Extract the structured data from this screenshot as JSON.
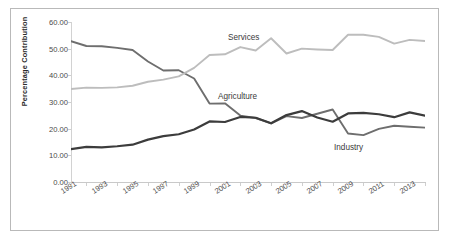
{
  "chart_data": {
    "type": "line",
    "title": "",
    "subtitle": "",
    "xlabel": "",
    "ylabel": "Percentage Contribution",
    "xlim": [
      1991,
      2014
    ],
    "ylim": [
      0,
      60
    ],
    "grid": false,
    "legend_position": "inline-annotations",
    "x": [
      1991,
      1992,
      1993,
      1994,
      1995,
      1996,
      1997,
      1998,
      1999,
      2000,
      2001,
      2002,
      2003,
      2004,
      2005,
      2006,
      2007,
      2008,
      2009,
      2010,
      2011,
      2012,
      2013,
      2014
    ],
    "y_ticks": [
      0,
      10,
      20,
      30,
      40,
      50,
      60
    ],
    "y_tick_labels": [
      "0.00",
      "10.00",
      "20.00",
      "30.00",
      "40.00",
      "50.00",
      "60.00"
    ],
    "x_tick_labels": [
      "1991",
      "1993",
      "1995",
      "1997",
      "1999",
      "2001",
      "2003",
      "2005",
      "2007",
      "2009",
      "2011",
      "2013"
    ],
    "x_tick_values": [
      1991,
      1993,
      1995,
      1997,
      1999,
      2001,
      2003,
      2005,
      2007,
      2009,
      2011,
      2013
    ],
    "series": [
      {
        "name": "Agriculture",
        "color": "#6e6e6e",
        "width": 1.9,
        "values": [
          52.8,
          51.0,
          50.9,
          50.3,
          49.5,
          45.2,
          41.8,
          41.9,
          38.8,
          29.4,
          29.5,
          24.9,
          24.0,
          22.0,
          24.7,
          24.0,
          25.6,
          27.2,
          18.2,
          17.6,
          19.9,
          21.1,
          20.7,
          20.4
        ]
      },
      {
        "name": "Services",
        "color": "#bdbdbd",
        "width": 1.9,
        "values": [
          34.9,
          35.4,
          35.3,
          35.5,
          36.1,
          37.6,
          38.4,
          39.6,
          42.8,
          47.6,
          47.9,
          50.6,
          49.3,
          53.9,
          48.2,
          50.0,
          49.7,
          49.5,
          55.2,
          55.2,
          54.4,
          51.9,
          53.3,
          52.9
        ]
      },
      {
        "name": "Industry",
        "color": "#3c3c3c",
        "width": 2.2,
        "values": [
          12.3,
          13.2,
          13.0,
          13.4,
          14.0,
          15.9,
          17.2,
          17.9,
          19.7,
          22.7,
          22.5,
          24.4,
          24.1,
          22.0,
          25.1,
          26.6,
          24.2,
          22.6,
          25.7,
          25.9,
          25.4,
          24.3,
          26.1,
          24.9
        ]
      }
    ],
    "annotations": [
      {
        "text": "Services",
        "series": "Services",
        "x_px": 228,
        "y_px": 33
      },
      {
        "text": "Agriculture",
        "series": "Agriculture",
        "x_px": 218,
        "y_px": 92
      },
      {
        "text": "Industry",
        "series": "Industry",
        "x_px": 334,
        "y_px": 143
      }
    ]
  }
}
